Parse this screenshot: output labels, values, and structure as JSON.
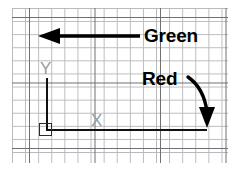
{
  "diagram": {
    "background_color": "#ffffff",
    "grid": {
      "minor_color": "#b9b9bd",
      "major_color": "#6e6e73",
      "minor_spacing_px": 13,
      "major_every_n_cells": 5
    },
    "axes": {
      "color": "#111111",
      "y_label": "Y",
      "x_label": "X",
      "marker_label_color": "#9a9a9f",
      "origin_marker": "square"
    },
    "annotations": [
      {
        "id": "green",
        "label": "Green",
        "arrow": "straight-left",
        "arrow_color": "#000000",
        "text_color": "#000000"
      },
      {
        "id": "red",
        "label": "Red",
        "arrow": "curved-down",
        "arrow_color": "#000000",
        "text_color": "#000000"
      }
    ]
  }
}
